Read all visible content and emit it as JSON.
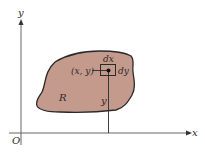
{
  "diagram": {
    "type": "double-integral-region",
    "axes": {
      "x_label": "x",
      "y_label": "y",
      "origin_label": "O"
    },
    "region": {
      "label": "R",
      "fill_color": "#c49a8c",
      "outline_color": "#2a2a2a"
    },
    "element": {
      "point_label": "(x, y)",
      "width_label": "dx",
      "height_label": "dy",
      "height_to_axis_label": "y"
    },
    "colors": {
      "ink": "#2a2a2a",
      "background": "#ffffff"
    }
  }
}
